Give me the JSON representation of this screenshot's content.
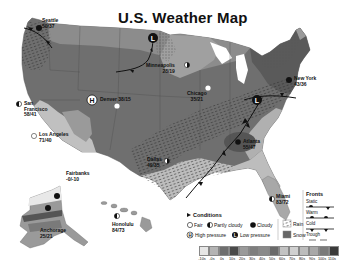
{
  "title": "U.S. Weather Map",
  "cities": [
    {
      "name": "Seattle",
      "temps": "50/37",
      "condition": "cloudy"
    },
    {
      "name": "Minneapolis",
      "temps": "28/19",
      "condition": "partly-cloudy"
    },
    {
      "name": "New York",
      "temps": "43/36",
      "condition": "cloudy"
    },
    {
      "name": "San Francisco",
      "temps": "58/41",
      "condition": "partly-cloudy"
    },
    {
      "name": "Denver",
      "temps": "38/15",
      "condition": "fair"
    },
    {
      "name": "Chicago",
      "temps": "35/21",
      "condition": "fair"
    },
    {
      "name": "Los Angeles",
      "temps": "71/40",
      "condition": "fair"
    },
    {
      "name": "Atlanta",
      "temps": "55/47",
      "condition": "cloudy"
    },
    {
      "name": "Dallas",
      "temps": "49/35",
      "condition": "partly-cloudy"
    },
    {
      "name": "Fairbanks",
      "temps": "-0/-10",
      "condition": "cloudy"
    },
    {
      "name": "Anchorage",
      "temps": "25/21",
      "condition": "cloudy"
    },
    {
      "name": "Honolulu",
      "temps": "84/73",
      "condition": "partly-cloudy"
    },
    {
      "name": "Miami",
      "temps": "83/72",
      "condition": "partly-cloudy"
    }
  ],
  "pressure_centers": [
    {
      "type": "H",
      "label": "High pressure",
      "location": "Colorado"
    },
    {
      "type": "L",
      "label": "Low pressure",
      "location": "Minnesota"
    },
    {
      "type": "L",
      "label": "Low pressure",
      "location": "Pennsylvania"
    }
  ],
  "legend": {
    "conditions_title": "Conditions",
    "fair": "Fair",
    "partly_cloudy": "Partly cloudy",
    "cloudy": "Cloudy",
    "high_pressure": "High pressure",
    "low_pressure": "Low pressure",
    "rain": "Rain",
    "snow": "Snow",
    "high_symbol": "H",
    "low_symbol": "L",
    "fronts_title": "Fronts",
    "fronts": [
      "Static",
      "Warm",
      "Cold",
      "Trough"
    ]
  },
  "temperature_scale": {
    "labels": [
      "-10s",
      "-0s",
      "0s",
      "10s",
      "20s",
      "30s",
      "40s",
      "50s",
      "60s",
      "70s",
      "80s",
      "90s",
      "100s",
      "110s"
    ],
    "colors": [
      "#e6e6e6",
      "#b4b4b4",
      "#6e6e6e",
      "#4a4a4a",
      "#9a9a9a",
      "#7e7e7e",
      "#8a8a8a",
      "#6a6a6a",
      "#c2c2c2",
      "#d0d0d0",
      "#bcbcbc",
      "#a8a8a8",
      "#7a7a7a",
      "#3a3a3a"
    ]
  }
}
